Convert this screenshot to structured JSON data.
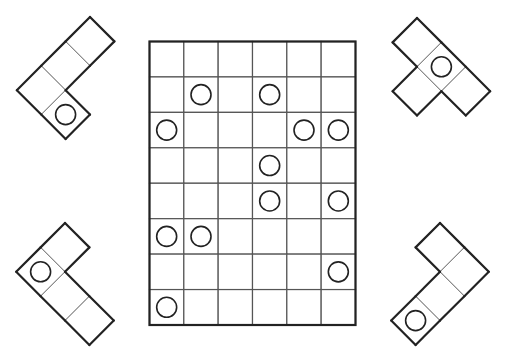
{
  "puzzle": {
    "title": "Grid with circles and L-shaped tetromino pieces",
    "board": {
      "columns": 6,
      "rows": 8,
      "circles": [
        {
          "row": 1,
          "col": 1
        },
        {
          "row": 1,
          "col": 3
        },
        {
          "row": 2,
          "col": 0
        },
        {
          "row": 2,
          "col": 4
        },
        {
          "row": 2,
          "col": 5
        },
        {
          "row": 3,
          "col": 3
        },
        {
          "row": 4,
          "col": 3
        },
        {
          "row": 4,
          "col": 5
        },
        {
          "row": 5,
          "col": 0
        },
        {
          "row": 5,
          "col": 1
        },
        {
          "row": 6,
          "col": 5
        },
        {
          "row": 7,
          "col": 0
        }
      ]
    },
    "pieces": [
      {
        "id": "piece-top-left",
        "position": "top-left",
        "shape": "L-tetromino",
        "circle_cells": 1
      },
      {
        "id": "piece-top-right",
        "position": "top-right",
        "shape": "L-tetromino",
        "circle_cells": 1
      },
      {
        "id": "piece-bottom-left",
        "position": "bottom-left",
        "shape": "L-tetromino",
        "circle_cells": 1
      },
      {
        "id": "piece-bottom-right",
        "position": "bottom-right",
        "shape": "L-tetromino",
        "circle_cells": 1
      }
    ],
    "colors": {
      "line": "#222222",
      "inner_line": "#777777",
      "background": "#ffffff"
    }
  }
}
